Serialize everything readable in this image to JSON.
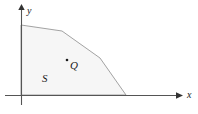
{
  "figure": {
    "background_color": "#ffffff",
    "width": 198,
    "height": 114
  },
  "axes": {
    "line_color": "#555555",
    "x_axis": {
      "label": "x",
      "label_x": 187,
      "label_y": 98,
      "y": 95,
      "start_x": 5,
      "end_x": 178,
      "arrow": "arrow-right"
    },
    "y_axis": {
      "label": "y",
      "label_x": 26,
      "label_y": 14,
      "x": 21,
      "start_y": 105,
      "end_y": 8,
      "arrow": "arrow-up"
    }
  },
  "region": {
    "name": "S",
    "label": "S",
    "label_x": 42,
    "label_y": 82,
    "fill_color": "#f6f6f6",
    "stroke_color": "#8c8c8c",
    "stroke_width": 0.8,
    "vertices": [
      [
        21,
        25
      ],
      [
        62,
        31
      ],
      [
        100,
        58
      ],
      [
        126,
        95
      ],
      [
        21,
        95
      ]
    ]
  },
  "point": {
    "name": "Q",
    "label": "Q",
    "dot_x": 67,
    "dot_y": 60,
    "dot_radius": 1.3,
    "dot_color": "#1a1a1a",
    "label_x": 70,
    "label_y": 69
  }
}
